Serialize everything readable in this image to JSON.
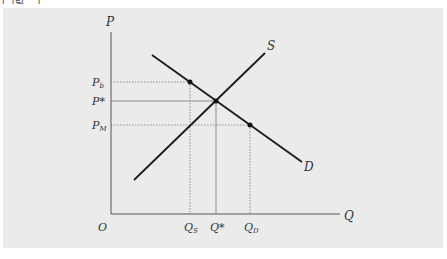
{
  "caption": "[그림 ...]",
  "diagram": {
    "type": "supply-demand",
    "axes": {
      "y_label": "P",
      "x_label": "Q",
      "origin_label": "O"
    },
    "curves": {
      "supply_label": "S",
      "demand_label": "D"
    },
    "price_labels": {
      "p_b": "P",
      "p_b_sub": "b",
      "p_star": "P*",
      "p_m": "P",
      "p_m_sub": "M"
    },
    "quantity_labels": {
      "q_s": "Q",
      "q_s_sub": "S",
      "q_star": "Q*",
      "q_d": "Q",
      "q_d_sub": "D"
    },
    "colors": {
      "background": "#ebebeb",
      "curve": "#1a1a1a",
      "axis": "#555555",
      "guide": "#777777"
    }
  }
}
